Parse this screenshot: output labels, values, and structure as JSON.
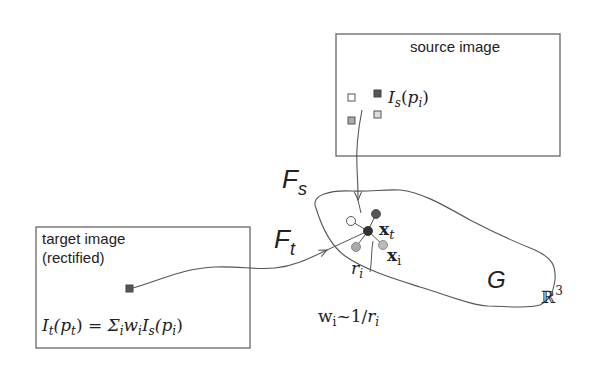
{
  "diagram": {
    "source_box": {
      "label": "source image",
      "pixel_label_main": "I",
      "pixel_label_sub": "s",
      "pixel_label_arg_open": "(",
      "pixel_label_arg": "p",
      "pixel_label_arg_sub": "i",
      "pixel_label_arg_close": ")"
    },
    "target_box": {
      "label_line1": "target image",
      "label_line2": "(rectified)",
      "equation": {
        "lhs_main": "I",
        "lhs_sub": "t",
        "lhs_arg": "(p",
        "lhs_arg_sub": "t",
        "lhs_close": ")",
        "equals": " = ",
        "sigma": "Σ",
        "sigma_sub": "i",
        "w": "w",
        "w_sub": "i",
        "rhs_main": "I",
        "rhs_sub": "s",
        "rhs_arg": "(p",
        "rhs_arg_sub": "i",
        "rhs_close": ")"
      }
    },
    "mappings": {
      "source_map": {
        "main": "F",
        "sub": "s"
      },
      "target_map": {
        "main": "F",
        "sub": "t"
      }
    },
    "geometry": {
      "surface_label": "G",
      "space_label": "ℝ",
      "space_exp": "3",
      "point_target": {
        "main": "x",
        "sub": "t"
      },
      "point_sample": {
        "main": "x",
        "sub": "i"
      },
      "distance": {
        "main": "r",
        "sub": "i"
      }
    },
    "weight_formula": {
      "w": "w",
      "w_sub": "i",
      "tilde": "~1/",
      "r": "r",
      "r_sub": "i"
    },
    "colors": {
      "line": "#555555",
      "box_border": "#666666",
      "dark_node": "#444444",
      "gray_node": "#aaaaaa",
      "light_node": "#ffffff"
    }
  }
}
